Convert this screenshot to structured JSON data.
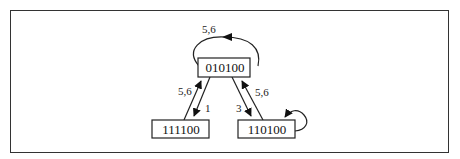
{
  "diagram": {
    "type": "state-transition-graph",
    "nodes": [
      {
        "id": "n_top",
        "label": "010100"
      },
      {
        "id": "n_left",
        "label": "111100"
      },
      {
        "id": "n_right",
        "label": "110100"
      }
    ],
    "edges": [
      {
        "from": "010100",
        "to": "010100",
        "label": "5,6"
      },
      {
        "from": "111100",
        "to": "010100",
        "label": "5,6"
      },
      {
        "from": "010100",
        "to": "111100",
        "label": "1"
      },
      {
        "from": "010100",
        "to": "110100",
        "label": "3"
      },
      {
        "from": "110100",
        "to": "010100",
        "label": "5,6"
      },
      {
        "from": "110100",
        "to": "110100",
        "label": ""
      }
    ]
  },
  "labels": {
    "node_top": "010100",
    "node_left": "111100",
    "node_right": "110100",
    "edge_top_self": "5,6",
    "edge_left_up": "5,6",
    "edge_left_down": "1",
    "edge_right_down": "3",
    "edge_right_up": "5,6"
  },
  "colors": {
    "stroke": "#222222",
    "background": "#ffffff",
    "frame": "#333333"
  }
}
